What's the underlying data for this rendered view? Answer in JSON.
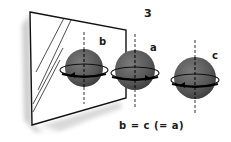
{
  "figure": {
    "number": "3",
    "caption": "b = c (= a)",
    "labels": {
      "b": "b",
      "a": "a",
      "c": "c"
    }
  },
  "elements": {
    "mirror": "mirror-frame",
    "spheres": [
      {
        "id": "b",
        "role": "reflection in mirror"
      },
      {
        "id": "a",
        "role": "real sphere"
      },
      {
        "id": "c",
        "role": "rotated sphere"
      }
    ]
  },
  "colors": {
    "sphere_fill": "#5a5a5a",
    "outline": "#111111",
    "shadow": "#c8c8c8",
    "background": "#ffffff"
  }
}
